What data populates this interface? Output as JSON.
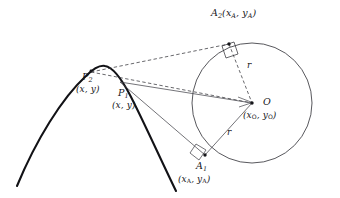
{
  "figure": {
    "type": "geometry-diagram",
    "background_color": "#ffffff",
    "stroke_color": "#1a1a1e",
    "curve_color": "#111114",
    "width": 340,
    "height": 198
  },
  "labels": {
    "a2": {
      "name": "A",
      "subscript": "2",
      "coords": "(x",
      "coord_sub_1": "A",
      "coord_mid": ", y",
      "coord_sub_2": "A",
      "coord_end": ")",
      "full": "A₂(xᴀ, yᴀ)"
    },
    "p2": {
      "name": "P",
      "subscript": "2",
      "coords": "(x, y)"
    },
    "p1": {
      "name": "P",
      "subscript": "1",
      "coords": "(x, y)"
    },
    "a1": {
      "name": "A",
      "subscript": "1",
      "coords_open": "(x",
      "coord_sub_1": "A",
      "coord_mid": ", y",
      "coord_sub_2": "A",
      "coord_close": ")"
    },
    "o": {
      "name": "O",
      "coords_open": "(x",
      "coord_sub_1": "O",
      "coord_mid": ", y",
      "coord_sub_2": "O",
      "coord_close": ")"
    },
    "radius_upper": "r",
    "radius_lower": "r"
  },
  "geometry": {
    "circle": {
      "cx": 252,
      "cy": 103,
      "r": 60
    },
    "points": {
      "P2": {
        "x": 91,
        "y": 72
      },
      "P1": {
        "x": 124,
        "y": 83
      },
      "A2": {
        "x": 229,
        "y": 44
      },
      "A1": {
        "x": 205,
        "y": 155
      },
      "O": {
        "x": 252,
        "y": 103
      }
    },
    "parabola": {
      "apex_x": 103,
      "apex_y": 67,
      "left_end_x": 17,
      "left_end_y": 186,
      "right_end_x": 176,
      "right_end_y": 191
    }
  }
}
